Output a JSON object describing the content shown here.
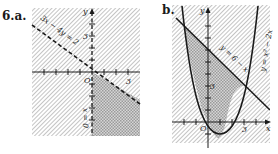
{
  "problem_number": "6.",
  "part_a": {
    "label": "a.",
    "boundary_line_label": "3x − 4y = 2",
    "vertical_boundary_label": "x = 0",
    "axis_x": "x",
    "axis_y": "y",
    "origin": "O",
    "tick_label_y": "3",
    "tick_label_x": "3"
  },
  "part_b": {
    "label": "b.",
    "line_label": "y = 6 − x",
    "parabola_label": "y = x² − 2x",
    "axis_x": "x",
    "axis_y": "y",
    "origin": "O",
    "tick_label_y": "3",
    "tick_label_x": "3"
  },
  "colors": {
    "ink": "#1a1a1a",
    "hatch": "#9a9a9a",
    "crosshatch_fill": "#bdbdbd"
  }
}
